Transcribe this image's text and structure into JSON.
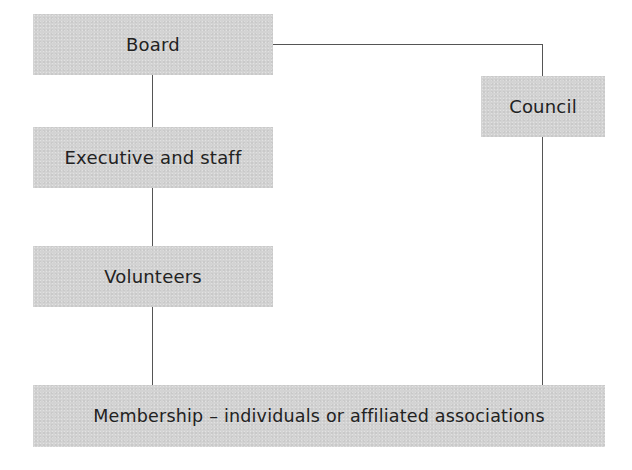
{
  "diagram": {
    "type": "organizational-structure",
    "nodes": [
      {
        "id": "board",
        "label": "Board"
      },
      {
        "id": "council",
        "label": "Council"
      },
      {
        "id": "executive",
        "label": "Executive and staff"
      },
      {
        "id": "volunteers",
        "label": "Volunteers"
      },
      {
        "id": "membership",
        "label": "Membership – individuals or affiliated associations"
      }
    ],
    "edges": [
      {
        "from": "board",
        "to": "executive"
      },
      {
        "from": "executive",
        "to": "volunteers"
      },
      {
        "from": "volunteers",
        "to": "membership"
      },
      {
        "from": "board",
        "to": "council"
      },
      {
        "from": "council",
        "to": "membership"
      }
    ],
    "colors": {
      "box_fill": "#d3d3d3",
      "text": "#222222",
      "connector": "#555555",
      "background": "#ffffff"
    }
  }
}
